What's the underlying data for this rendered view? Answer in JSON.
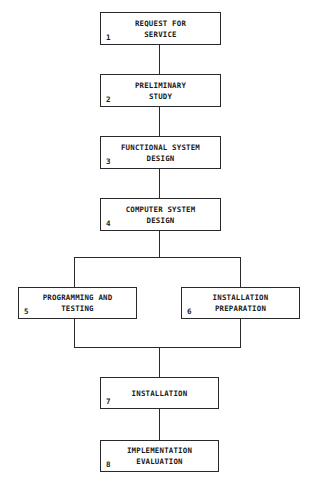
{
  "diagram": {
    "type": "flowchart",
    "steps": [
      {
        "num": "1",
        "label": "REQUEST FOR\nSERVICE"
      },
      {
        "num": "2",
        "label": "PRELIMINARY\nSTUDY"
      },
      {
        "num": "3",
        "label": "FUNCTIONAL SYSTEM\nDESIGN"
      },
      {
        "num": "4",
        "label": "COMPUTER SYSTEM\nDESIGN"
      },
      {
        "num": "5",
        "label": "PROGRAMMING AND\nTESTING"
      },
      {
        "num": "6",
        "label": "INSTALLATION\nPREPARATION"
      },
      {
        "num": "7",
        "label": "INSTALLATION"
      },
      {
        "num": "8",
        "label": "IMPLEMENTATION\nEVALUATION"
      }
    ],
    "edges": [
      [
        "1",
        "2"
      ],
      [
        "2",
        "3"
      ],
      [
        "3",
        "4"
      ],
      [
        "4",
        "5"
      ],
      [
        "4",
        "6"
      ],
      [
        "5",
        "7"
      ],
      [
        "6",
        "7"
      ],
      [
        "7",
        "8"
      ]
    ]
  }
}
